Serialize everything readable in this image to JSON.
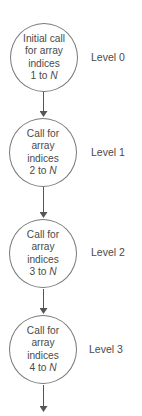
{
  "diagram": {
    "type": "recursion-call-chain",
    "colors": {
      "stroke": "#7a7a7a",
      "text": "#4a4a4a",
      "background": "#ffffff"
    },
    "nodes": [
      {
        "id": "call-0",
        "lines": [
          "Initial call",
          "for array",
          "indices"
        ],
        "range_prefix": "1 to ",
        "range_var": "N",
        "level_label": "Level 0"
      },
      {
        "id": "call-1",
        "lines": [
          "Call for",
          "array",
          "indices"
        ],
        "range_prefix": "2 to ",
        "range_var": "N",
        "level_label": "Level 1"
      },
      {
        "id": "call-2",
        "lines": [
          "Call for",
          "array",
          "indices"
        ],
        "range_prefix": "3 to ",
        "range_var": "N",
        "level_label": "Level 2"
      },
      {
        "id": "call-3",
        "lines": [
          "Call for",
          "array",
          "indices"
        ],
        "range_prefix": "4 to ",
        "range_var": "N",
        "level_label": "Level 3"
      }
    ],
    "edges": [
      {
        "from": "call-0",
        "to": "call-1"
      },
      {
        "from": "call-1",
        "to": "call-2"
      },
      {
        "from": "call-2",
        "to": "call-3"
      },
      {
        "from": "call-3",
        "to": "continuation"
      }
    ]
  }
}
